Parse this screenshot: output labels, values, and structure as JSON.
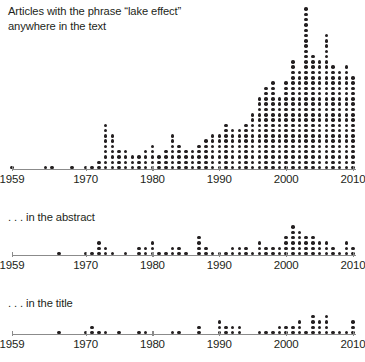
{
  "figure": {
    "axis_color": "#8b8b8b",
    "dot_color": "#231f20",
    "text_color": "#231f20"
  },
  "panels": [
    {
      "name": "text-panel",
      "title": "Articles with the phrase “lake effect”\nanywhere in the text",
      "title_line1": "Articles with the phrase “lake effect”",
      "title_line2": "anywhere in the text"
    },
    {
      "name": "abstract-panel",
      "title": ". . . in the abstract"
    },
    {
      "name": "title-panel",
      "title": ". . . in the title"
    }
  ],
  "axis": {
    "tick_labels": [
      "1959",
      "1970",
      "1980",
      "1990",
      "2000",
      "2010"
    ],
    "tick_years": [
      1959,
      1970,
      1980,
      1990,
      2000,
      2010
    ],
    "x_min": 1959,
    "x_max": 2010
  },
  "chart_data": [
    {
      "type": "bar",
      "name": "text",
      "title": "Articles with the phrase “lake effect” anywhere in the text",
      "xlabel": "",
      "ylabel": "",
      "grid": false,
      "legend": "none",
      "unit": "one dot = one article",
      "xlim": [
        1959,
        2010
      ],
      "ylim": [
        0,
        32
      ],
      "x": [
        1959,
        1960,
        1961,
        1962,
        1963,
        1964,
        1965,
        1966,
        1967,
        1968,
        1969,
        1970,
        1971,
        1972,
        1973,
        1974,
        1975,
        1976,
        1977,
        1978,
        1979,
        1980,
        1981,
        1982,
        1983,
        1984,
        1985,
        1986,
        1987,
        1988,
        1989,
        1990,
        1991,
        1992,
        1993,
        1994,
        1995,
        1996,
        1997,
        1998,
        1999,
        2000,
        2001,
        2002,
        2003,
        2004,
        2005,
        2006,
        2007,
        2008,
        2009,
        2010
      ],
      "values": [
        1,
        0,
        0,
        0,
        0,
        1,
        1,
        0,
        0,
        1,
        0,
        1,
        1,
        2,
        9,
        7,
        4,
        4,
        3,
        3,
        4,
        5,
        3,
        4,
        7,
        5,
        4,
        4,
        5,
        6,
        7,
        7,
        9,
        8,
        8,
        9,
        11,
        14,
        16,
        17,
        14,
        17,
        21,
        19,
        31,
        22,
        21,
        26,
        20,
        19,
        20,
        18
      ]
    },
    {
      "type": "bar",
      "name": "abstract",
      "title": ". . . in the abstract",
      "xlabel": "",
      "ylabel": "",
      "grid": false,
      "legend": "none",
      "unit": "one dot = one article",
      "xlim": [
        1959,
        2010
      ],
      "ylim": [
        0,
        10
      ],
      "x": [
        1959,
        1960,
        1961,
        1962,
        1963,
        1964,
        1965,
        1966,
        1967,
        1968,
        1969,
        1970,
        1971,
        1972,
        1973,
        1974,
        1975,
        1976,
        1977,
        1978,
        1979,
        1980,
        1981,
        1982,
        1983,
        1984,
        1985,
        1986,
        1987,
        1988,
        1989,
        1990,
        1991,
        1992,
        1993,
        1994,
        1995,
        1996,
        1997,
        1998,
        1999,
        2000,
        2001,
        2002,
        2003,
        2004,
        2005,
        2006,
        2007,
        2008,
        2009,
        2010
      ],
      "values": [
        0,
        0,
        0,
        0,
        0,
        0,
        0,
        1,
        0,
        0,
        0,
        1,
        1,
        3,
        2,
        1,
        0,
        1,
        0,
        2,
        2,
        3,
        1,
        1,
        2,
        2,
        1,
        0,
        4,
        2,
        1,
        1,
        1,
        2,
        2,
        2,
        1,
        3,
        2,
        2,
        2,
        4,
        6,
        5,
        4,
        4,
        3,
        3,
        2,
        1,
        3,
        2
      ]
    },
    {
      "type": "bar",
      "name": "title",
      "title": ". . . in the title",
      "xlabel": "",
      "ylabel": "",
      "grid": false,
      "legend": "none",
      "unit": "one dot = one article",
      "xlim": [
        1959,
        2010
      ],
      "ylim": [
        0,
        6
      ],
      "x": [
        1959,
        1960,
        1961,
        1962,
        1963,
        1964,
        1965,
        1966,
        1967,
        1968,
        1969,
        1970,
        1971,
        1972,
        1973,
        1974,
        1975,
        1976,
        1977,
        1978,
        1979,
        1980,
        1981,
        1982,
        1983,
        1984,
        1985,
        1986,
        1987,
        1988,
        1989,
        1990,
        1991,
        1992,
        1993,
        1994,
        1995,
        1996,
        1997,
        1998,
        1999,
        2000,
        2001,
        2002,
        2003,
        2004,
        2005,
        2006,
        2007,
        2008,
        2009,
        2010
      ],
      "values": [
        0,
        0,
        0,
        0,
        0,
        0,
        0,
        1,
        0,
        0,
        0,
        1,
        2,
        1,
        1,
        0,
        1,
        0,
        0,
        1,
        1,
        0,
        0,
        0,
        1,
        1,
        0,
        0,
        2,
        0,
        0,
        3,
        2,
        2,
        2,
        0,
        0,
        1,
        1,
        1,
        2,
        2,
        2,
        3,
        1,
        4,
        3,
        4,
        1,
        1,
        1,
        3
      ]
    }
  ]
}
